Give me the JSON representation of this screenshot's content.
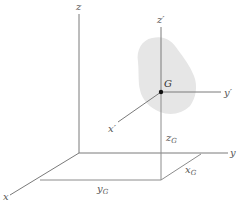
{
  "figure": {
    "colors": {
      "axis": "#7a7a7a",
      "body_fill": "#e6e6e6",
      "point": "#111111",
      "text": "#555555"
    }
  },
  "axes": {
    "x": "x",
    "y": "y",
    "z": "z"
  },
  "local_axes": {
    "x_prime": "x′",
    "y_prime": "y′",
    "z_prime": "z′"
  },
  "point": {
    "label": "G"
  },
  "dimensions": {
    "x_g": {
      "main": "x",
      "sub": "G"
    },
    "y_g": {
      "main": "y",
      "sub": "G"
    },
    "z_g": {
      "main": "z",
      "sub": "G"
    }
  }
}
